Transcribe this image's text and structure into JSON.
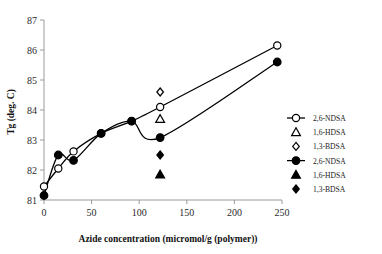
{
  "chart_data": {
    "type": "line",
    "title": "",
    "xlabel": "Azide concentration (micromol/g (polymer))",
    "ylabel": "Tg (deg. C)",
    "xlim": [
      0,
      250
    ],
    "ylim": [
      81,
      87
    ],
    "xticks": [
      "0",
      "50",
      "100",
      "150",
      "200",
      "250"
    ],
    "xtick_values": [
      0,
      50,
      100,
      150,
      200,
      250
    ],
    "yticks": [
      "81",
      "82",
      "83",
      "84",
      "85",
      "86",
      "87"
    ],
    "ytick_values": [
      81,
      82,
      83,
      84,
      85,
      86,
      87
    ],
    "grid": false,
    "legend_position": "right",
    "series": [
      {
        "name": "2,6-NDSA",
        "marker": "open-circle",
        "line": true,
        "x": [
          0,
          15,
          31,
          60,
          92,
          122,
          245
        ],
        "y": [
          81.45,
          82.05,
          82.62,
          83.22,
          83.63,
          84.1,
          86.15
        ]
      },
      {
        "name": "1,6-HDSA",
        "marker": "open-triangle",
        "line": false,
        "x": [
          122
        ],
        "y": [
          83.7
        ]
      },
      {
        "name": "1,3-BDSA",
        "marker": "open-diamond",
        "line": false,
        "x": [
          122
        ],
        "y": [
          84.6
        ]
      },
      {
        "name": "2,6-NDSA",
        "marker": "filled-circle",
        "line": true,
        "x": [
          0,
          15,
          31,
          60,
          92,
          122,
          245
        ],
        "y": [
          81.15,
          82.5,
          82.32,
          83.22,
          83.63,
          83.08,
          85.6
        ]
      },
      {
        "name": "1,6-HDSA",
        "marker": "filled-triangle",
        "line": false,
        "x": [
          122
        ],
        "y": [
          81.85
        ]
      },
      {
        "name": "1,3-BDSA",
        "marker": "filled-diamond",
        "line": false,
        "x": [
          122
        ],
        "y": [
          82.5
        ]
      }
    ]
  },
  "legend": {
    "entries": [
      {
        "label": "2,6-NDSA",
        "marker": "open-circle",
        "line": true
      },
      {
        "label": "1,6-HDSA",
        "marker": "open-triangle",
        "line": false
      },
      {
        "label": "1,3-BDSA",
        "marker": "open-diamond",
        "line": false
      },
      {
        "label": "2,6-NDSA",
        "marker": "filled-circle",
        "line": true
      },
      {
        "label": "1,6-HDSA",
        "marker": "filled-triangle",
        "line": false
      },
      {
        "label": "1,3-BDSA",
        "marker": "filled-diamond",
        "line": false
      }
    ]
  },
  "colors": {
    "series": "#000000",
    "axis": "#9a9a9a",
    "text": "#1a1a1a",
    "background": "#ffffff"
  }
}
